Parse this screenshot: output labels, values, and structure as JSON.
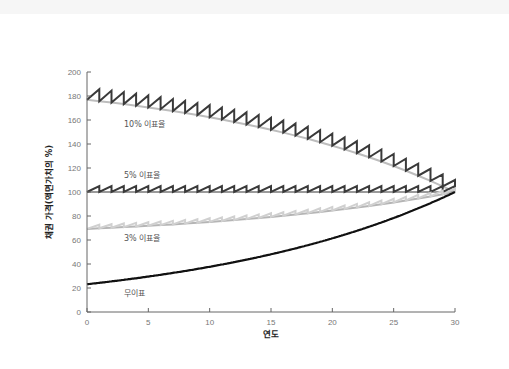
{
  "chart_data": {
    "type": "line",
    "title": "",
    "xlabel": "연도",
    "ylabel": "채권 가격(액면가치의 %)",
    "xlim": [
      0,
      30
    ],
    "ylim": [
      0,
      200
    ],
    "xticks": [
      0,
      5,
      10,
      15,
      20,
      25,
      30
    ],
    "yticks": [
      0,
      20,
      40,
      60,
      80,
      100,
      120,
      140,
      160,
      180,
      200
    ],
    "grid": false,
    "legend": "inline labels",
    "yield_assumed_percent": 5,
    "series": [
      {
        "name": "10% 이표율",
        "coupon": 10,
        "color": "#444444",
        "style": "sawtooth (full price) over clean price curve",
        "x": [
          0,
          5,
          10,
          15,
          20,
          25,
          30
        ],
        "values": [
          176.9,
          169.1,
          159.2,
          146.4,
          130.9,
          111.0,
          100.0
        ]
      },
      {
        "name": "5% 이표율",
        "coupon": 5,
        "color": "#444444",
        "style": "sawtooth around flat 100",
        "x": [
          0,
          5,
          10,
          15,
          20,
          25,
          30
        ],
        "values": [
          100,
          100,
          100,
          100,
          100,
          100,
          100
        ]
      },
      {
        "name": "3% 이표율",
        "coupon": 3,
        "color": "#c8c8c8",
        "style": "sawtooth (light gray)",
        "x": [
          0,
          5,
          10,
          15,
          20,
          25,
          30
        ],
        "values": [
          69.3,
          72.6,
          76.6,
          81.7,
          87.5,
          95.6,
          100.0
        ]
      },
      {
        "name": "무이표",
        "coupon": 0,
        "color": "#111111",
        "style": "smooth curve",
        "x": [
          0,
          5,
          10,
          15,
          20,
          25,
          30
        ],
        "values": [
          23.1,
          29.5,
          37.7,
          48.1,
          61.4,
          78.4,
          100.0
        ]
      }
    ],
    "annotations": [
      {
        "text": "10% 이표율",
        "x": 3,
        "y": 158
      },
      {
        "text": "5% 이표율",
        "x": 3,
        "y": 114
      },
      {
        "text": "3% 이표율",
        "x": 3,
        "y": 60
      },
      {
        "text": "무이표",
        "x": 3,
        "y": 17
      }
    ]
  },
  "labels": {
    "xlabel": "연도",
    "ylabel": "채권 가격(액면가치의 %)",
    "s10": "10% 이표율",
    "s5": "5% 이표율",
    "s3": "3% 이표율",
    "s0": "무이표"
  }
}
